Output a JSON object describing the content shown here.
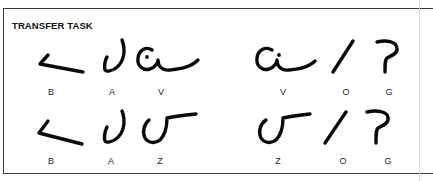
{
  "figure": {
    "title": "TRANSFER TASK",
    "rows": [
      {
        "left_group": {
          "symbols": [
            "B",
            "A",
            "V"
          ]
        },
        "right_group": {
          "symbols": [
            "V",
            "O",
            "G"
          ]
        }
      },
      {
        "left_group": {
          "symbols": [
            "B",
            "A",
            "Z"
          ]
        },
        "right_group": {
          "symbols": [
            "Z",
            "O",
            "G"
          ]
        }
      }
    ],
    "glyph_legend": {
      "B": "angle-bracket-glyph",
      "A": "hook-glyph",
      "V": "c-dot-swash-glyph",
      "Z": "reverse-s-bar-glyph",
      "O": "slash-glyph",
      "G": "question-hook-glyph"
    }
  },
  "colors": {
    "ink": "#0a0a0a",
    "border": "#3a3a3a",
    "background": "#ffffff"
  }
}
